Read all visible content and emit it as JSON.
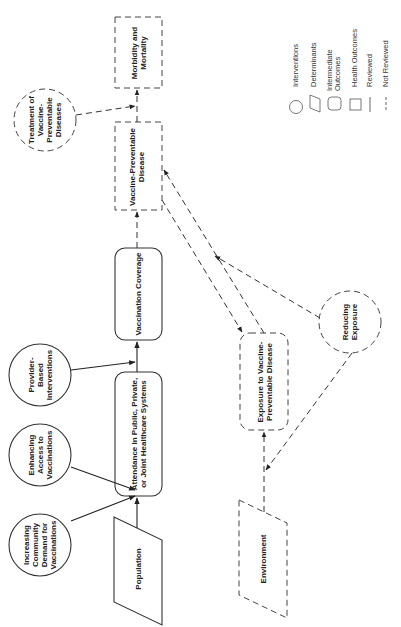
{
  "diagram": {
    "orientation": "rotated-90-ccw",
    "nodes": {
      "morbidity": {
        "label": "Morbidity and Mortality",
        "type": "health-outcome",
        "reviewed": false
      },
      "treatment": {
        "label": "Treatment of Vaccine-Preventable Diseases",
        "type": "intervention",
        "reviewed": false
      },
      "vpd": {
        "label": "Vaccine-Preventable Disease",
        "type": "health-outcome",
        "reviewed": false
      },
      "coverage": {
        "label": "Vaccination Coverage",
        "type": "intermediate-outcome",
        "reviewed": true
      },
      "provider": {
        "label": "Provider-Based Interventions",
        "type": "intervention",
        "reviewed": true
      },
      "attendance": {
        "label": "Attendance in Public, Private, or Joint Healthcare Systems",
        "type": "intermediate-outcome",
        "reviewed": true
      },
      "access": {
        "label": "Enhancing Access to Vaccinations",
        "type": "intervention",
        "reviewed": true
      },
      "demand": {
        "label": "Increasing Community Demand for Vaccinations",
        "type": "intervention",
        "reviewed": true
      },
      "population": {
        "label": "Population",
        "type": "determinant",
        "reviewed": true
      },
      "exposure": {
        "label": "Exposure to Vaccine-Preventable Disease",
        "type": "intermediate-outcome",
        "reviewed": false
      },
      "reducing": {
        "label": "Reducing Exposure",
        "type": "intervention",
        "reviewed": false
      },
      "environment": {
        "label": "Environment",
        "type": "determinant",
        "reviewed": false
      }
    },
    "edges": [
      {
        "from": "population",
        "to": "attendance",
        "style": "solid"
      },
      {
        "from": "demand",
        "to": "attendance",
        "style": "solid"
      },
      {
        "from": "access",
        "to": "attendance",
        "style": "solid"
      },
      {
        "from": "attendance",
        "to": "coverage",
        "style": "solid"
      },
      {
        "from": "provider",
        "to": "coverage",
        "style": "solid"
      },
      {
        "from": "coverage",
        "to": "vpd",
        "style": "dashed"
      },
      {
        "from": "vpd",
        "to": "morbidity",
        "style": "dashed"
      },
      {
        "from": "treatment",
        "to": "morbidity",
        "style": "dashed"
      },
      {
        "from": "environment",
        "to": "exposure",
        "style": "dashed"
      },
      {
        "from": "reducing",
        "to": "environment-exposure-link",
        "style": "dashed"
      },
      {
        "from": "reducing",
        "to": "vpd-exposure-link",
        "style": "dashed"
      },
      {
        "from": "exposure",
        "to": "vpd",
        "style": "dashed"
      },
      {
        "from": "vpd",
        "to": "exposure",
        "style": "dashed"
      }
    ]
  },
  "legend": {
    "items": [
      {
        "shape": "circle",
        "label": "Interventions"
      },
      {
        "shape": "parallelogram",
        "label": "Determinants"
      },
      {
        "shape": "rounded-rect",
        "label": "Intermediate Outcomes"
      },
      {
        "shape": "rect",
        "label": "Health Outcomes"
      },
      {
        "shape": "solid-line",
        "label": "Reviewed"
      },
      {
        "shape": "dashed-line",
        "label": "Not Reviewed"
      }
    ]
  },
  "colors": {
    "stroke": "#333333",
    "dashed_stroke": "#555555",
    "text": "#222222",
    "background": "#ffffff"
  }
}
